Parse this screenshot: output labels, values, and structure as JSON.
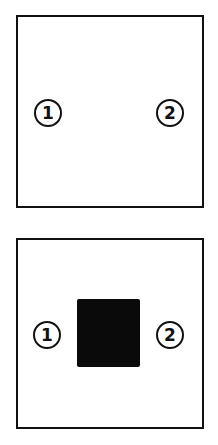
{
  "panels": [
    {
      "markers": [
        {
          "label": "1"
        },
        {
          "label": "2"
        }
      ],
      "has_block": false
    },
    {
      "markers": [
        {
          "label": "1"
        },
        {
          "label": "2"
        }
      ],
      "has_block": true
    }
  ],
  "colors": {
    "ink": "#111111",
    "block": "#0a0a0a",
    "background": "#ffffff"
  }
}
